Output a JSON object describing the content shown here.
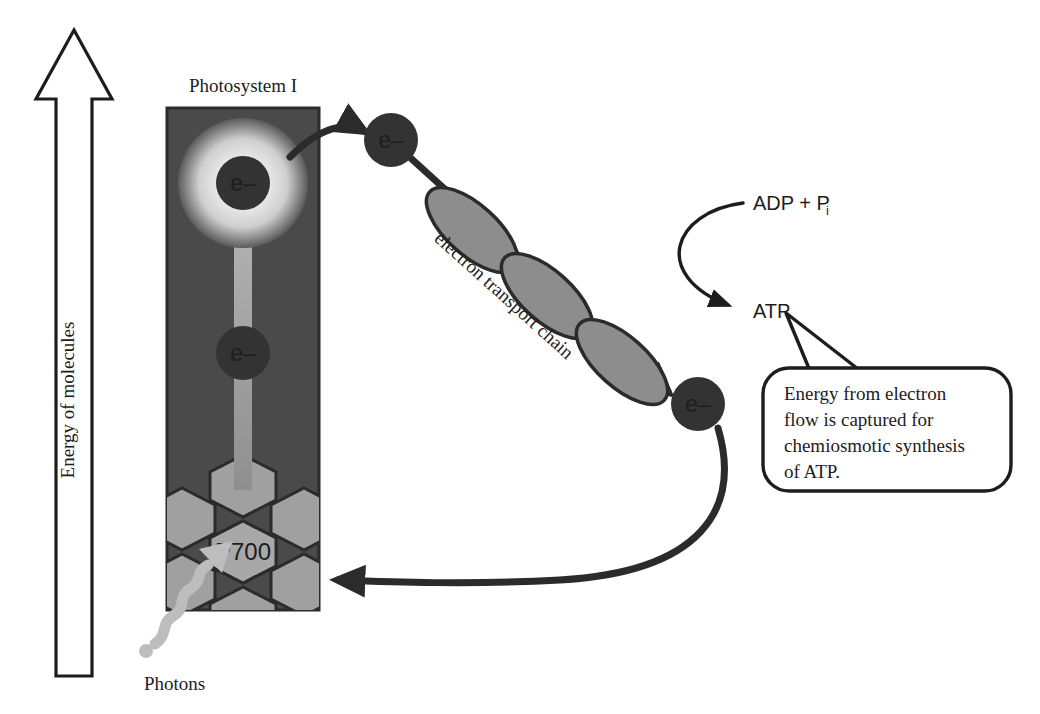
{
  "diagram": {
    "background_color": "#ffffff",
    "ink_color": "#1d1d1d"
  },
  "energy_axis": {
    "label": "Energy of molecules",
    "direction": "up",
    "arrow_fill": "#ffffff",
    "arrow_stroke": "#1d1d1d"
  },
  "photosystem": {
    "label": "Photosystem I",
    "body_color": "#4a4a4a",
    "border_color": "#2b2b2b",
    "reaction_center": {
      "label": "P700",
      "fill": "#a8a8a8"
    },
    "glow": {
      "inner_color": "#e8e8e8",
      "outer_color": "#4a4a4a"
    },
    "excited_electron": {
      "label": "e–"
    },
    "ground_electron": {
      "label": "e–"
    },
    "excitation_shaft_color": "#9c9c9c"
  },
  "photons": {
    "label": "Photons",
    "color": "#bdbdbd"
  },
  "transport_chain": {
    "label": "electron transport chain",
    "carrier_fill": "#8d8d8d",
    "carrier_stroke": "#2b2b2b",
    "carrier_count": 3
  },
  "electrons": [
    {
      "name": "electron-leaving-photosystem",
      "label": "e–"
    },
    {
      "name": "electron-entering-photosystem",
      "label": "e–"
    }
  ],
  "atp_cycle": {
    "reactants": "ADP + P",
    "reactants_subscript": "i",
    "product": "ATP"
  },
  "callout": {
    "lines": [
      "Energy from electron",
      "flow is captured for",
      "chemiosmotic synthesis",
      "of ATP."
    ],
    "border_color": "#1d1d1d",
    "fill": "#ffffff"
  },
  "electron_label": "e–",
  "electron_circle_fill": "#333333",
  "electron_text_fill": "#ffffff"
}
